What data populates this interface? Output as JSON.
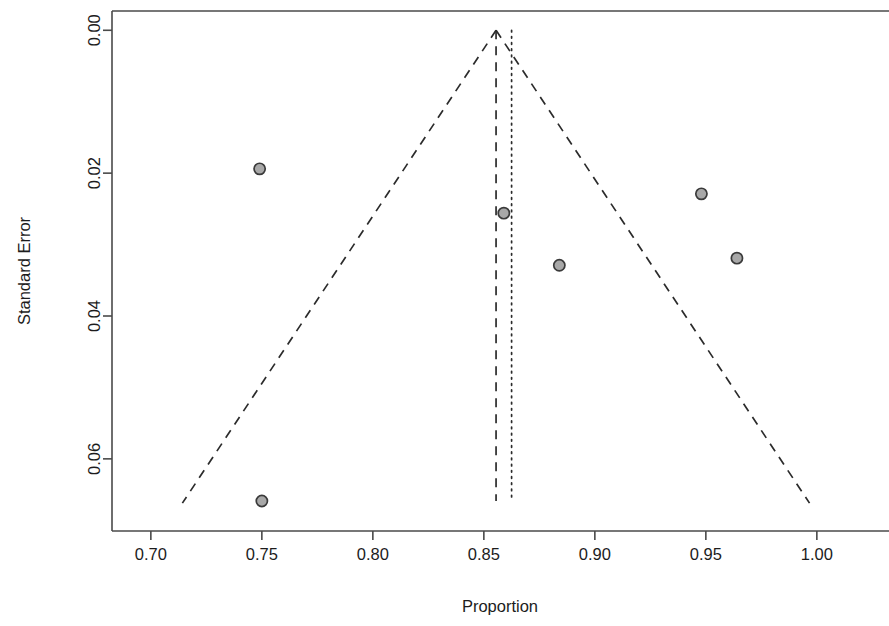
{
  "chart_data": {
    "type": "scatter",
    "title": "",
    "subtitle": "",
    "xlabel": "Proportion",
    "ylabel": "Standard Error",
    "xlim": [
      0.6825,
      1.0325
    ],
    "ylim": [
      0.0701,
      -0.0027
    ],
    "y_axis_reversed": true,
    "grid": false,
    "legend": null,
    "xticks": [
      0.7,
      0.75,
      0.8,
      0.85,
      0.9,
      0.95,
      1.0
    ],
    "xtick_labels": [
      "0.70",
      "0.75",
      "0.80",
      "0.85",
      "0.90",
      "0.95",
      "1.00"
    ],
    "yticks": [
      0.0,
      0.02,
      0.04,
      0.06
    ],
    "ytick_labels": [
      "0.00",
      "0.02",
      "0.04",
      "0.06"
    ],
    "points": [
      {
        "x": 0.749,
        "y": 0.0194
      },
      {
        "x": 0.859,
        "y": 0.0256
      },
      {
        "x": 0.884,
        "y": 0.0329
      },
      {
        "x": 0.948,
        "y": 0.0229
      },
      {
        "x": 0.964,
        "y": 0.0319
      },
      {
        "x": 0.75,
        "y": 0.0659
      }
    ],
    "marker": {
      "shape": "circle",
      "radius_px": 5.6,
      "fill_color": "#a8a8a8",
      "edge_color": "#3a3a3a"
    },
    "reference_lines": [
      {
        "name": "fixed-effect-estimate",
        "style": "dashed",
        "x": 0.8555,
        "y_from": 0.0,
        "y_to": 0.0659
      },
      {
        "name": "null-or-random-estimate",
        "style": "dotted",
        "x": 0.8625,
        "y_from": 0.0,
        "y_to": 0.0659
      }
    ],
    "funnel": {
      "apex_x": 0.8555,
      "apex_y": 0.0,
      "left_bottom_x": 0.7142,
      "right_bottom_x": 0.9967,
      "bottom_y": 0.0662,
      "style": "dashed",
      "confidence": "95%"
    },
    "annotations": []
  },
  "figure": {
    "background_color": "#ffffff",
    "axis_color": "#4a4a4a",
    "line_color": "#2b2b2b"
  }
}
